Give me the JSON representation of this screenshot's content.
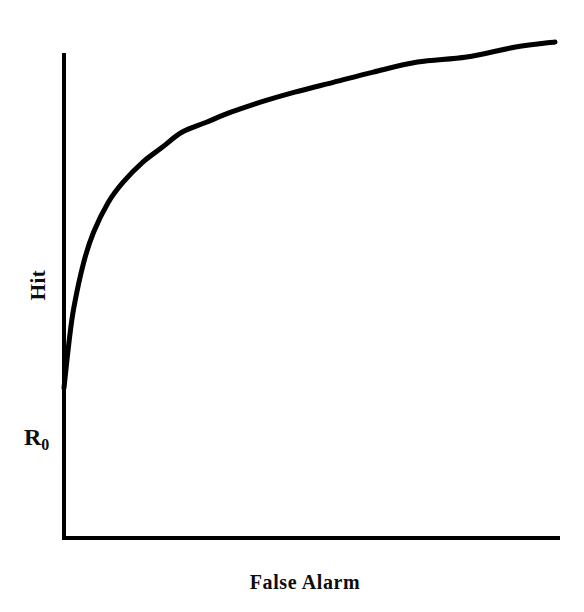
{
  "chart_data": {
    "type": "line",
    "title": "",
    "subtitle": "",
    "xlabel": "False Alarm",
    "ylabel": "Hit",
    "annotations": [
      {
        "text": "R0",
        "display": "R",
        "subscript": "0",
        "meaning": "baseline hit rate at zero false alarm rate",
        "axis": "y",
        "x": 0.0,
        "y": 0.31
      }
    ],
    "legend": [],
    "legend_position": "none",
    "grid": false,
    "xlim": [
      0,
      1
    ],
    "ylim": [
      0,
      1
    ],
    "x_tick_labels": [],
    "y_tick_labels": [],
    "axis_color": "#000000",
    "curve_color": "#000000",
    "background_color": "#ffffff",
    "series": [
      {
        "name": "ROC curve",
        "x": [
          0.0,
          0.01,
          0.02,
          0.04,
          0.06,
          0.09,
          0.12,
          0.16,
          0.2,
          0.24,
          0.29,
          0.34,
          0.4,
          0.47,
          0.55,
          0.63,
          0.72,
          0.82,
          0.92,
          1.0
        ],
        "y": [
          0.31,
          0.4,
          0.47,
          0.56,
          0.62,
          0.68,
          0.72,
          0.76,
          0.79,
          0.82,
          0.84,
          0.86,
          0.88,
          0.9,
          0.92,
          0.94,
          0.96,
          0.97,
          0.99,
          1.0
        ]
      }
    ]
  },
  "labels": {
    "y_axis": "Hit",
    "y_baseline": "R",
    "y_baseline_subscript": "0",
    "x_axis": "False Alarm"
  },
  "geometry": {
    "origin_x": 64,
    "origin_y": 538,
    "y_axis_top": 53,
    "x_axis_right": 560,
    "curve_start_x": 64,
    "curve_start_y": 388,
    "curve_end_x": 555,
    "curve_end_y": 42,
    "axis_stroke_width": 4,
    "curve_stroke_width": 5
  }
}
